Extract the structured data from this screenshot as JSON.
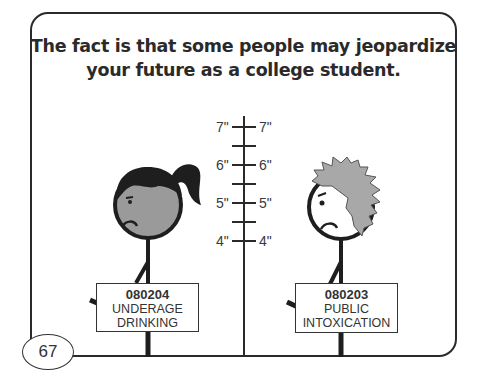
{
  "title_lines": [
    "The fact is that some people may jeopardize",
    "your future as a college student."
  ],
  "ruler": {
    "labels": [
      {
        "left": "7\"",
        "right": "7\""
      },
      {
        "left": "6\"",
        "right": "6\""
      },
      {
        "left": "5\"",
        "right": "5\""
      },
      {
        "left": "4\"",
        "right": "4\""
      }
    ]
  },
  "figures": [
    {
      "name": "girl",
      "hair": "black ponytail",
      "expression": "frown",
      "sign": {
        "number": "080204",
        "line1": "UNDERAGE",
        "line2": "DRINKING"
      }
    },
    {
      "name": "boy",
      "hair": "gray spiky",
      "expression": "frown",
      "sign": {
        "number": "080203",
        "line1": "PUBLIC",
        "line2": "INTOXICATION"
      }
    }
  ],
  "page_number": "67",
  "colors": {
    "ink": "#2a2a2a",
    "face": "#9a9a9a",
    "hair_boy": "#a8a8a8",
    "hair_girl": "#1e1e1e"
  }
}
